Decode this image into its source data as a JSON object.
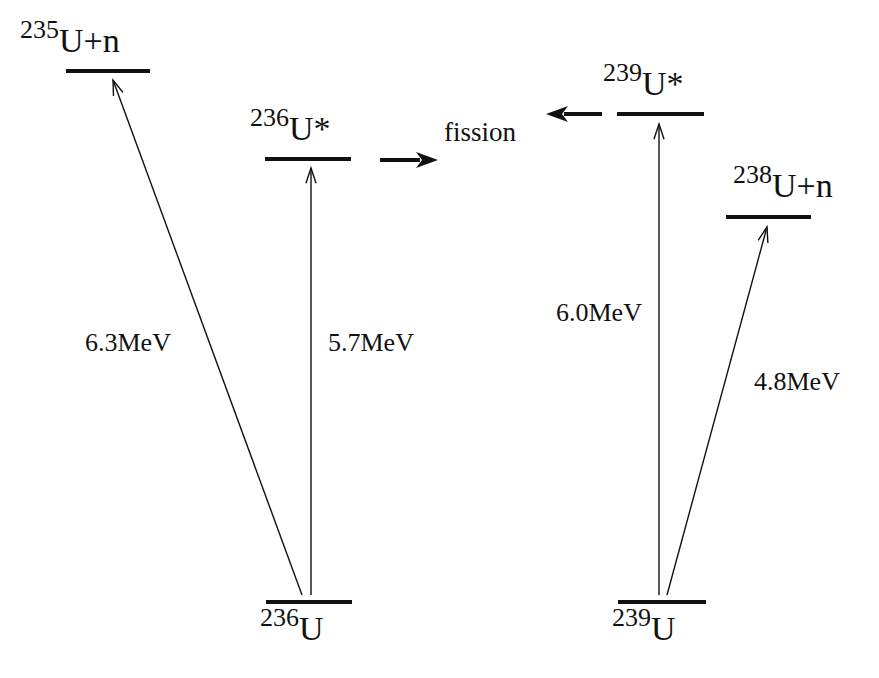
{
  "diagram": {
    "type": "energy-level-diagram",
    "colors": {
      "ink": "#111111",
      "background": "#ffffff"
    },
    "levels": [
      {
        "id": "u235n",
        "mass": "235",
        "symbol": "U+n",
        "x1": 66,
        "x2": 150,
        "y": 71,
        "label_x": 20,
        "label_y": 52
      },
      {
        "id": "u236star",
        "mass": "236",
        "symbol": "U*",
        "x1": 265,
        "x2": 351,
        "y": 159,
        "label_x": 250,
        "label_y": 140
      },
      {
        "id": "u236",
        "mass": "236",
        "symbol": "U",
        "x1": 266,
        "x2": 352,
        "y": 602,
        "label_x": 260,
        "label_y": 640
      },
      {
        "id": "u239star",
        "mass": "239",
        "symbol": "U*",
        "x1": 617,
        "x2": 704,
        "y": 114,
        "label_x": 603,
        "label_y": 95
      },
      {
        "id": "u238n",
        "mass": "238",
        "symbol": "U+n",
        "x1": 726,
        "x2": 811,
        "y": 217,
        "label_x": 733,
        "label_y": 197
      },
      {
        "id": "u239",
        "mass": "239",
        "symbol": "U",
        "x1": 618,
        "x2": 706,
        "y": 602,
        "label_x": 612,
        "label_y": 640
      }
    ],
    "transitions": [
      {
        "from": "u236",
        "to": "u235n",
        "x1": 302,
        "y1": 595,
        "x2": 113,
        "y2": 80,
        "energy": "6.3MeV",
        "label_x": 85,
        "label_y": 351
      },
      {
        "from": "u236",
        "to": "u236star",
        "x1": 311,
        "y1": 595,
        "x2": 311,
        "y2": 168,
        "energy": "5.7MeV",
        "label_x": 328,
        "label_y": 351
      },
      {
        "from": "u239",
        "to": "u239star",
        "x1": 659,
        "y1": 595,
        "x2": 659,
        "y2": 124,
        "energy": "6.0MeV",
        "label_x": 556,
        "label_y": 321
      },
      {
        "from": "u239",
        "to": "u238n",
        "x1": 667,
        "y1": 595,
        "x2": 767,
        "y2": 227,
        "energy": "4.8MeV",
        "label_x": 754,
        "label_y": 390
      }
    ],
    "fission": {
      "label": "fission",
      "label_x": 444,
      "label_y": 141,
      "arrows": [
        {
          "from": "u236star",
          "x1": 380,
          "y1": 160,
          "x2": 438,
          "y2": 160
        },
        {
          "from": "u239star",
          "x1": 602,
          "y1": 114,
          "x2": 546,
          "y2": 114
        }
      ]
    }
  }
}
